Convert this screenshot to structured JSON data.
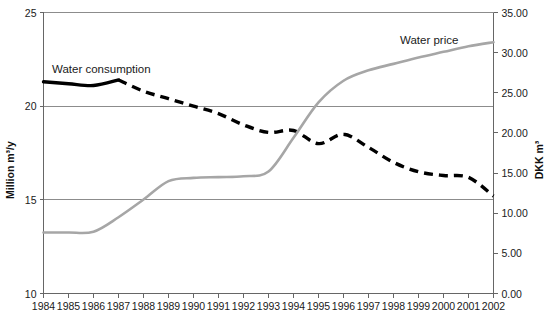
{
  "chart_data": {
    "type": "line",
    "title": "",
    "xlabel": "",
    "ylabel": "Million m³/y",
    "y2label": "DKK m³",
    "grid": true,
    "legend_position": "inline-annotation",
    "x": [
      1984,
      1985,
      1986,
      1987,
      1988,
      1989,
      1990,
      1991,
      1992,
      1993,
      1994,
      1995,
      1996,
      1997,
      1998,
      1999,
      2000,
      2001,
      2002
    ],
    "x_tick_labels": [
      "1984",
      "1985",
      "1986",
      "1987",
      "1988",
      "1989",
      "1990",
      "1991",
      "1992",
      "1993",
      "1994",
      "1995",
      "1996",
      "1997",
      "1998",
      "1999",
      "2000",
      "2001",
      "2002"
    ],
    "ylim": [
      10,
      25
    ],
    "y_tick_labels": [
      "25",
      "20",
      "15",
      "10"
    ],
    "y_ticks": [
      25,
      20,
      15,
      10
    ],
    "y2lim": [
      0,
      35
    ],
    "y2_tick_labels": [
      "35.00",
      "30.00",
      "25.00",
      "20.00",
      "15.00",
      "10.00",
      "5.00",
      "0.00"
    ],
    "y2_ticks": [
      35,
      30,
      25,
      20,
      15,
      10,
      5,
      0
    ],
    "series": [
      {
        "name": "Water consumption",
        "axis": "left",
        "unit": "Million m³/y",
        "style": "dashed-black",
        "color": "#000000",
        "solid_until": 1987,
        "values": [
          21.3,
          21.2,
          21.1,
          21.4,
          20.8,
          20.4,
          20.0,
          19.6,
          19.0,
          18.6,
          18.7,
          18.0,
          18.5,
          17.8,
          17.0,
          16.5,
          16.3,
          16.2,
          15.2
        ]
      },
      {
        "name": "Water price",
        "axis": "right",
        "unit": "DKK m³",
        "style": "solid-gray",
        "color": "#a6a6a6",
        "values": [
          7.6,
          7.6,
          7.7,
          9.5,
          11.7,
          14.0,
          14.4,
          14.5,
          14.6,
          15.2,
          19.4,
          23.8,
          26.5,
          27.8,
          28.6,
          29.4,
          30.1,
          30.8,
          31.3
        ]
      }
    ],
    "annotations": [
      {
        "text": "Water consumption",
        "series": "Water consumption",
        "x_px": 52,
        "y_px": 73
      },
      {
        "text": "Water price",
        "series": "Water price",
        "x_px": 400,
        "y_px": 44
      }
    ]
  }
}
